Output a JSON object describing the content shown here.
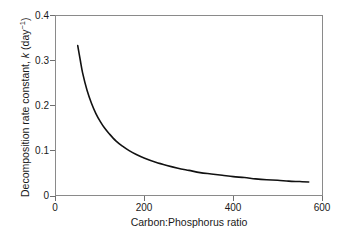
{
  "figure": {
    "background_color": "#ffffff",
    "frame_color": "#8a8a8a",
    "curve_color": "#111111"
  },
  "axes": {
    "x": {
      "title": "Carbon:Phosphorus ratio",
      "tick_labels": [
        "0",
        "200",
        "400",
        "600"
      ],
      "tick_values": [
        0,
        200,
        400,
        600
      ],
      "min": 0,
      "max": 600
    },
    "y": {
      "title_prefix": "Decomposition rate constant, ",
      "title_symbol": "k",
      "title_units_open": " (day",
      "title_units_exp": "−1",
      "title_units_close": ")",
      "title_plain": "Decomposition rate constant, k (day−1)",
      "tick_labels": [
        "0",
        "0.1",
        "0.2",
        "0.3",
        "0.4"
      ],
      "tick_values": [
        0,
        0.1,
        0.2,
        0.3,
        0.4
      ],
      "min": 0,
      "max": 0.4
    }
  },
  "chart_data": {
    "type": "line",
    "title": "",
    "xlabel": "Carbon:Phosphorus ratio",
    "ylabel": "Decomposition rate constant, k (day−1)",
    "xlim": [
      0,
      600
    ],
    "ylim": [
      0,
      0.4
    ],
    "xticks": [
      0,
      200,
      400,
      600
    ],
    "yticks": [
      0,
      0.1,
      0.2,
      0.3,
      0.4
    ],
    "grid": false,
    "legend": "none",
    "relationship": "k decreases hyperbolically with C:P ratio, approximately k = 16.4 / (C:P)",
    "series": [
      {
        "name": "Decomposition rate constant",
        "color": "#111111",
        "line_width": 1.6,
        "x": [
          49,
          55,
          60,
          70,
          80,
          90,
          100,
          110,
          120,
          135,
          150,
          165,
          180,
          200,
          225,
          250,
          275,
          300,
          325,
          350,
          375,
          400,
          425,
          450,
          475,
          500,
          525,
          550,
          570
        ],
        "y": [
          0.334,
          0.3,
          0.273,
          0.234,
          0.205,
          0.182,
          0.164,
          0.149,
          0.137,
          0.121,
          0.109,
          0.099,
          0.091,
          0.082,
          0.073,
          0.066,
          0.06,
          0.055,
          0.05,
          0.047,
          0.044,
          0.041,
          0.039,
          0.036,
          0.034,
          0.033,
          0.031,
          0.03,
          0.029
        ]
      }
    ]
  }
}
